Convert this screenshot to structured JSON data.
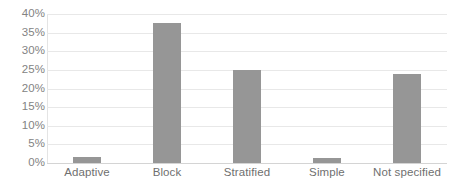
{
  "chart_data": {
    "type": "bar",
    "title": "",
    "subtitle": "",
    "xlabel": "",
    "ylabel": "",
    "categories": [
      "Adaptive",
      "Block",
      "Stratified",
      "Simple",
      "Not specified"
    ],
    "values": [
      1.5,
      37.5,
      25.0,
      1.3,
      24.0
    ],
    "value_labels": [
      "1.5%",
      "37.5%",
      "25.0%",
      "1.3%",
      "24.0%"
    ],
    "ylim": [
      0,
      40
    ],
    "ytick_values": [
      40,
      35,
      30,
      25,
      20,
      15,
      10,
      5,
      0
    ],
    "ytick_labels": [
      "40%",
      "35%",
      "30%",
      "25%",
      "20%",
      "15%",
      "10%",
      "5%",
      "0%"
    ],
    "grid": true,
    "grid_axis": "y",
    "legend": false,
    "legend_position": "none",
    "series": [
      {
        "name": "Randomisation method",
        "values": [
          1.5,
          37.5,
          25.0,
          1.3,
          24.0
        ]
      }
    ],
    "colors": {
      "bar": "#969696",
      "gridline": "#e8e8e8",
      "axis": "#d4d4d4",
      "tick_text": "#838383",
      "category_text": "#6f6f6f",
      "background": "#ffffff"
    }
  }
}
